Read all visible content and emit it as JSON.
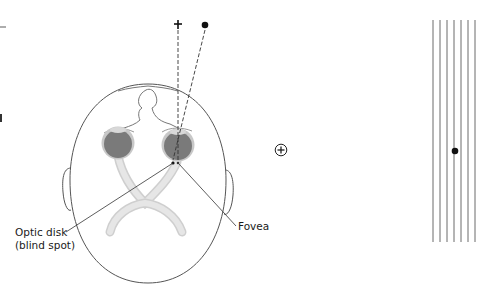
{
  "figure": {
    "labels": {
      "optic_disk_line1": "Optic disk",
      "optic_disk_line2": "(blind spot)",
      "fovea": "Fovea"
    },
    "targets": {
      "fixation_cross": "+",
      "blind_spot_dot": "●",
      "circled_plus": "⊕"
    },
    "grating": {
      "line_count": 7,
      "dot_on_line": 4
    },
    "colors": {
      "outline": "#555555",
      "eyeball": "#7a7a7a",
      "eyeball_rim": "#c4c4c4",
      "nerve": "#dcdcdc",
      "lines": "#6b6b6b",
      "text": "#1a1a1a"
    }
  }
}
